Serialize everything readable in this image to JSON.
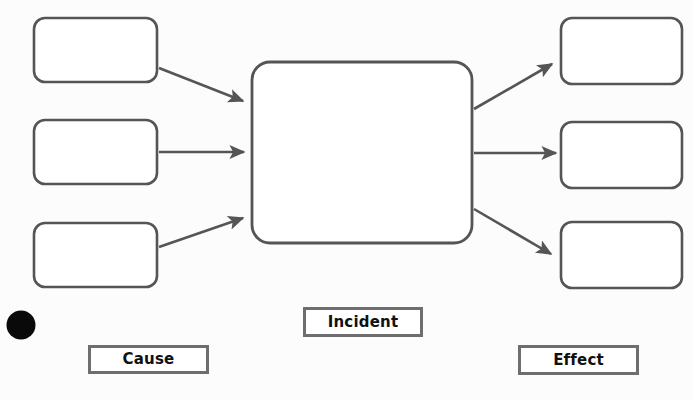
{
  "diagram": {
    "background_color": "#fcfcfc",
    "node_border_color": "#555555",
    "arrow_color": "#555555",
    "legend_border_color": "#6e6e6e",
    "marker_color": "#000000"
  },
  "legend": {
    "cause_label": "Cause",
    "incident_label": "Incident",
    "effect_label": "Effect"
  },
  "nodes": {
    "cause_boxes": [
      {
        "name": "cause-box-1",
        "text": ""
      },
      {
        "name": "cause-box-2",
        "text": ""
      },
      {
        "name": "cause-box-3",
        "text": ""
      }
    ],
    "incident_box": {
      "name": "incident-box",
      "text": ""
    },
    "effect_boxes": [
      {
        "name": "effect-box-1",
        "text": ""
      },
      {
        "name": "effect-box-2",
        "text": ""
      },
      {
        "name": "effect-box-3",
        "text": ""
      }
    ]
  },
  "connectors": [
    {
      "name": "arrow-cause-1-to-incident",
      "from": "cause-box-1",
      "to": "incident-box"
    },
    {
      "name": "arrow-cause-2-to-incident",
      "from": "cause-box-2",
      "to": "incident-box"
    },
    {
      "name": "arrow-cause-3-to-incident",
      "from": "cause-box-3",
      "to": "incident-box"
    },
    {
      "name": "arrow-incident-to-effect-1",
      "from": "incident-box",
      "to": "effect-box-1"
    },
    {
      "name": "arrow-incident-to-effect-2",
      "from": "incident-box",
      "to": "effect-box-2"
    },
    {
      "name": "arrow-incident-to-effect-3",
      "from": "incident-box",
      "to": "effect-box-3"
    }
  ],
  "marker": {
    "name": "bullet-marker",
    "shape": "filled-circle"
  }
}
